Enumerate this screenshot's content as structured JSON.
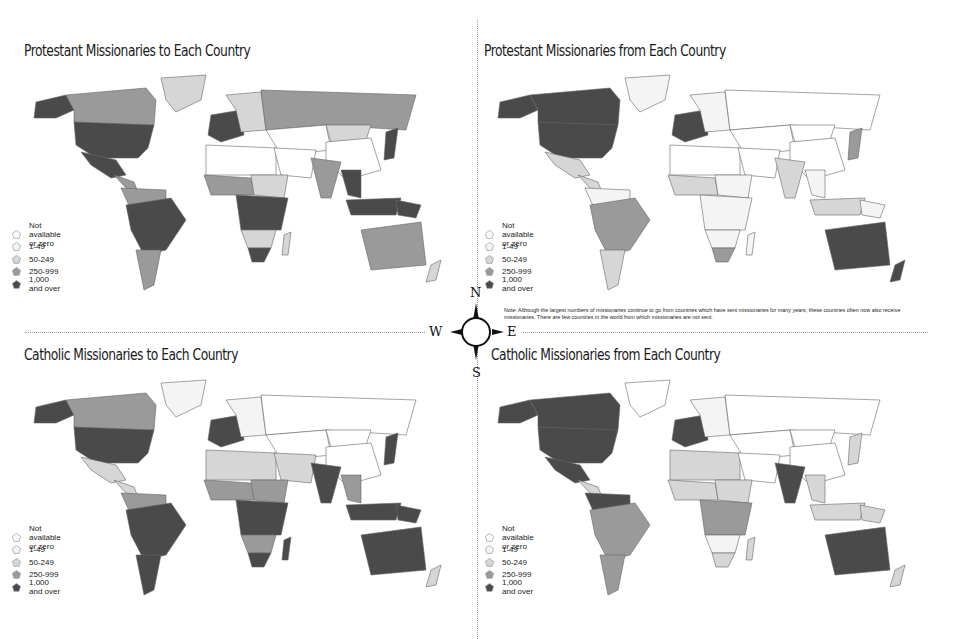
{
  "legend": {
    "items": [
      {
        "label": "Not available or zero",
        "color": "#ffffff"
      },
      {
        "label": "1-49",
        "color": "#f4f4f4"
      },
      {
        "label": "50-249",
        "color": "#d6d6d6"
      },
      {
        "label": "250-999",
        "color": "#9a9a9a"
      },
      {
        "label": "1,000 and over",
        "color": "#4a4a4a"
      }
    ]
  },
  "compass": {
    "n": "N",
    "s": "S",
    "e": "E",
    "w": "W"
  },
  "panels": {
    "protestant_to": {
      "title": "Protestant Missionaries to Each Country"
    },
    "protestant_from": {
      "title": "Protestant Missionaries from Each Country"
    },
    "catholic_to": {
      "title": "Catholic Missionaries to Each Country"
    },
    "catholic_from": {
      "title": "Catholic Missionaries from Each Country"
    }
  },
  "note": "Note: Although the largest numbers of missionaries continue to go from countries which have sent missionaries for many years, these countries often now also receive missionaries. There are few countries in the world from which missionaries are not sent.",
  "map_fills": {
    "protestant_to": {
      "canada": "#9a9a9a",
      "usa": "#4a4a4a",
      "alaska": "#4a4a4a",
      "greenland": "#d6d6d6",
      "mexico": "#4a4a4a",
      "central_america": "#9a9a9a",
      "south_north": "#9a9a9a",
      "brazil_andes": "#4a4a4a",
      "argentina": "#9a9a9a",
      "western_europe": "#4a4a4a",
      "eastern_europe": "#d6d6d6",
      "russia": "#9a9a9a",
      "central_asia": "#ffffff",
      "mongolia": "#d6d6d6",
      "china": "#ffffff",
      "japan": "#4a4a4a",
      "north_africa": "#ffffff",
      "west_africa": "#9a9a9a",
      "sahel": "#d6d6d6",
      "central_africa": "#4a4a4a",
      "southern_africa": "#d6d6d6",
      "south_africa": "#4a4a4a",
      "madagascar": "#d6d6d6",
      "middle_east": "#ffffff",
      "india": "#9a9a9a",
      "se_asia": "#4a4a4a",
      "indonesia": "#4a4a4a",
      "png": "#4a4a4a",
      "australia": "#9a9a9a",
      "nz": "#d6d6d6"
    },
    "protestant_from": {
      "canada": "#4a4a4a",
      "usa": "#4a4a4a",
      "alaska": "#4a4a4a",
      "greenland": "#f4f4f4",
      "mexico": "#d6d6d6",
      "central_america": "#d6d6d6",
      "south_north": "#f4f4f4",
      "brazil_andes": "#9a9a9a",
      "argentina": "#d6d6d6",
      "western_europe": "#4a4a4a",
      "eastern_europe": "#f4f4f4",
      "russia": "#ffffff",
      "central_asia": "#ffffff",
      "mongolia": "#ffffff",
      "china": "#ffffff",
      "japan": "#9a9a9a",
      "north_africa": "#ffffff",
      "west_africa": "#d6d6d6",
      "sahel": "#f4f4f4",
      "central_africa": "#f4f4f4",
      "southern_africa": "#f4f4f4",
      "south_africa": "#9a9a9a",
      "madagascar": "#f4f4f4",
      "middle_east": "#ffffff",
      "india": "#d6d6d6",
      "se_asia": "#f4f4f4",
      "indonesia": "#d6d6d6",
      "png": "#f4f4f4",
      "australia": "#4a4a4a",
      "nz": "#4a4a4a"
    },
    "catholic_to": {
      "canada": "#9a9a9a",
      "usa": "#4a4a4a",
      "alaska": "#4a4a4a",
      "greenland": "#f4f4f4",
      "mexico": "#d6d6d6",
      "central_america": "#d6d6d6",
      "south_north": "#9a9a9a",
      "brazil_andes": "#4a4a4a",
      "argentina": "#4a4a4a",
      "western_europe": "#4a4a4a",
      "eastern_europe": "#f4f4f4",
      "russia": "#ffffff",
      "central_asia": "#ffffff",
      "mongolia": "#ffffff",
      "china": "#ffffff",
      "japan": "#4a4a4a",
      "north_africa": "#d6d6d6",
      "west_africa": "#9a9a9a",
      "sahel": "#9a9a9a",
      "central_africa": "#4a4a4a",
      "southern_africa": "#9a9a9a",
      "south_africa": "#4a4a4a",
      "madagascar": "#4a4a4a",
      "middle_east": "#d6d6d6",
      "india": "#4a4a4a",
      "se_asia": "#9a9a9a",
      "indonesia": "#4a4a4a",
      "png": "#4a4a4a",
      "australia": "#4a4a4a",
      "nz": "#d6d6d6"
    },
    "catholic_from": {
      "canada": "#4a4a4a",
      "usa": "#4a4a4a",
      "alaska": "#4a4a4a",
      "greenland": "#ffffff",
      "mexico": "#4a4a4a",
      "central_america": "#d6d6d6",
      "south_north": "#4a4a4a",
      "brazil_andes": "#9a9a9a",
      "argentina": "#9a9a9a",
      "western_europe": "#4a4a4a",
      "eastern_europe": "#f4f4f4",
      "russia": "#ffffff",
      "central_asia": "#ffffff",
      "mongolia": "#ffffff",
      "china": "#ffffff",
      "japan": "#d6d6d6",
      "north_africa": "#d6d6d6",
      "west_africa": "#d6d6d6",
      "sahel": "#d6d6d6",
      "central_africa": "#9a9a9a",
      "southern_africa": "#f4f4f4",
      "south_africa": "#d6d6d6",
      "madagascar": "#d6d6d6",
      "middle_east": "#ffffff",
      "india": "#4a4a4a",
      "se_asia": "#d6d6d6",
      "indonesia": "#d6d6d6",
      "png": "#d6d6d6",
      "australia": "#4a4a4a",
      "nz": "#d6d6d6"
    }
  }
}
